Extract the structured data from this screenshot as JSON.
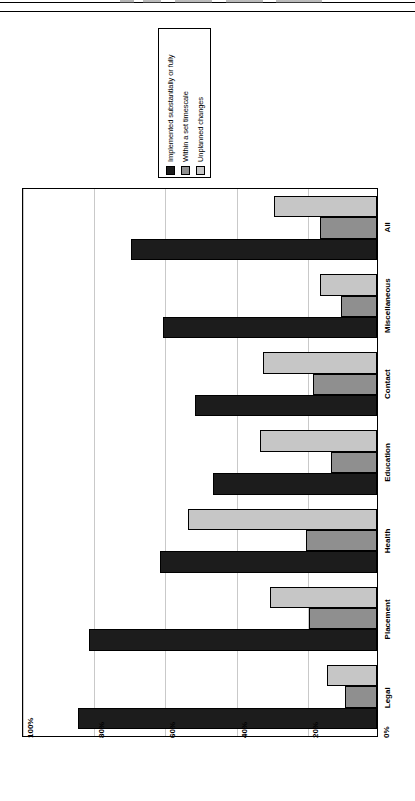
{
  "figure": {
    "orientation": "rotated-90-ccw",
    "legend": {
      "name": "chart-legend",
      "entries": [
        {
          "label": "Implemented substantially or fully",
          "color": "#1c1c1c"
        },
        {
          "label": "Within a set timescale",
          "color": "#8f8f8f"
        },
        {
          "label": "Unplanned changes",
          "color": "#c6c6c6"
        }
      ]
    }
  },
  "chart_data": {
    "type": "bar",
    "title": "",
    "xlabel": "",
    "ylabel": "",
    "ylim": [
      0,
      100
    ],
    "grid": true,
    "legend_position": "top-outside",
    "categories": [
      "Legal",
      "Placement",
      "Health",
      "Education",
      "Contact",
      "Miscellaneous",
      "All"
    ],
    "tick_labels": [
      "0%",
      "20%",
      "40%",
      "60%",
      "80%",
      "100%"
    ],
    "tick_values": [
      0,
      20,
      40,
      60,
      80,
      100
    ],
    "series": [
      {
        "name": "Implemented substantially or fully",
        "color": "#1c1c1c",
        "values": [
          84,
          81,
          61,
          46,
          51,
          60,
          69
        ]
      },
      {
        "name": "Within a set timescale",
        "color": "#8f8f8f",
        "values": [
          9,
          19,
          20,
          13,
          18,
          10,
          16
        ]
      },
      {
        "name": "Unplanned changes",
        "color": "#c6c6c6",
        "values": [
          14,
          30,
          53,
          33,
          32,
          16,
          29
        ]
      }
    ]
  }
}
